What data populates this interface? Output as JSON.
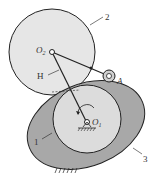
{
  "diagram": {
    "type": "mechanism",
    "labels": {
      "part2": "2",
      "o2": "O",
      "o2_sub": "2",
      "h": "H",
      "a": "A",
      "part1": "1",
      "o1": "O",
      "o1_sub": "1",
      "part3": "3"
    },
    "colors": {
      "circle2_fill": "#e6e6e6",
      "cam3_fill": "#a8a8a8",
      "circle1_fill": "#dcdcdc",
      "stroke": "#222222"
    }
  }
}
